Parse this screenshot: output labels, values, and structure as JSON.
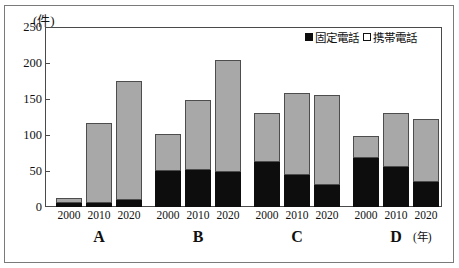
{
  "chart_data": {
    "type": "bar",
    "stacked": true,
    "title": "",
    "subtitle": "",
    "xlabel": "(年)",
    "ylabel": "(件)",
    "ylim": [
      0,
      250
    ],
    "yticks": [
      0,
      50,
      100,
      150,
      200,
      250
    ],
    "ytick_labels": [
      "0",
      "50",
      "100",
      "150",
      "200",
      "250"
    ],
    "grid": false,
    "legend_position": "top-right",
    "categories": [
      "A",
      "B",
      "C",
      "D"
    ],
    "sub_categories": [
      "2000",
      "2010",
      "2020"
    ],
    "series": [
      {
        "name": "固定電話",
        "color": "#0d0d0d",
        "values": [
          [
            5,
            5,
            10
          ],
          [
            50,
            51,
            49
          ],
          [
            62,
            45,
            30
          ],
          [
            68,
            55,
            35
          ]
        ]
      },
      {
        "name": "携帯電話",
        "color": "#a8a8a8",
        "values": [
          [
            8,
            112,
            165
          ],
          [
            52,
            97,
            155
          ],
          [
            68,
            114,
            125
          ],
          [
            30,
            75,
            87
          ]
        ]
      }
    ],
    "totals": [
      [
        13,
        117,
        175
      ],
      [
        102,
        148,
        204
      ],
      [
        130,
        159,
        155
      ],
      [
        98,
        130,
        122
      ]
    ],
    "annotations": []
  },
  "axis": {
    "y_unit": "(件)",
    "x_unit": "(年)",
    "y_tick_0": "0",
    "y_tick_1": "50",
    "y_tick_2": "100",
    "y_tick_3": "150",
    "y_tick_4": "200",
    "y_tick_5": "250"
  },
  "legend": {
    "items": [
      {
        "label": "固定電話",
        "swatch": "filled-black-square"
      },
      {
        "label": "携帯電話",
        "swatch": "open-white-square"
      }
    ]
  },
  "groups": [
    {
      "label": "A",
      "years": [
        "2000",
        "2010",
        "2020"
      ]
    },
    {
      "label": "B",
      "years": [
        "2000",
        "2010",
        "2020"
      ]
    },
    {
      "label": "C",
      "years": [
        "2000",
        "2010",
        "2020"
      ]
    },
    {
      "label": "D",
      "years": [
        "2000",
        "2010",
        "2020"
      ]
    }
  ]
}
